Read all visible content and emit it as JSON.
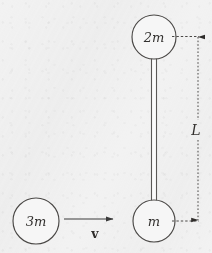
{
  "figure": {
    "background_color": "#f2f2f2",
    "ink_color": "#3a3a3a",
    "bodies": [
      {
        "id": "upper-mass",
        "label": "2m",
        "shape": "circle",
        "cx": 154,
        "cy": 37,
        "r": 22
      },
      {
        "id": "lower-mass",
        "label": "m",
        "shape": "circle",
        "cx": 154,
        "cy": 221,
        "r": 21
      },
      {
        "id": "incoming-mass",
        "label": "3m",
        "shape": "circle",
        "cx": 36,
        "cy": 221,
        "r": 23
      }
    ],
    "rod": {
      "id": "connecting-rod",
      "x_left": 151,
      "x_right": 157,
      "y_top": 57,
      "y_bottom": 202
    },
    "velocity_arrow": {
      "id": "velocity-arrow",
      "label": "v",
      "x_start": 64,
      "x_end": 117,
      "y": 219,
      "label_x": 95,
      "label_y": 238
    },
    "dimension": {
      "id": "length-dimension",
      "label": "L",
      "x": 198,
      "y_top": 37,
      "y_bottom": 221,
      "label_x": 196,
      "label_y": 134,
      "leader_top": {
        "x_start": 172,
        "x_end": 199,
        "y": 37
      },
      "leader_bottom": {
        "x_start": 172,
        "x_end": 199,
        "y": 221
      }
    }
  }
}
